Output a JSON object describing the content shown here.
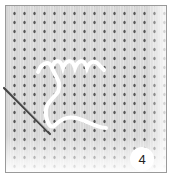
{
  "illustration": {
    "subject": "knitted fabric with white yarn and darning needle",
    "step_number": "4",
    "colors": {
      "fabric": "#cfcfcf",
      "fabric_hole": "#5a5a5a",
      "yarn": "#ffffff",
      "needle": "#444444",
      "frame": "#9a9a9a"
    }
  }
}
